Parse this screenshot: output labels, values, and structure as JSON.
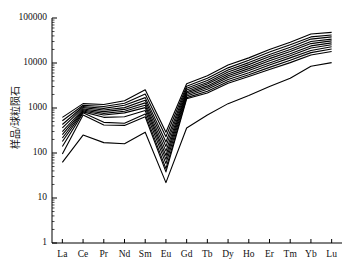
{
  "chart_data": {
    "type": "line",
    "title": "",
    "xlabel": "",
    "ylabel": "样品/球粒陨石",
    "x_categories": [
      "La",
      "Ce",
      "Pr",
      "Nd",
      "Sm",
      "Eu",
      "Gd",
      "Tb",
      "Dy",
      "Ho",
      "Er",
      "Tm",
      "Yb",
      "Lu"
    ],
    "y_tick_labels": [
      "100000",
      "10000",
      "1000",
      "100",
      "10",
      "1"
    ],
    "y_tick_values": [
      100000,
      10000,
      1000,
      100,
      10,
      1
    ],
    "ylim": [
      1,
      100000
    ],
    "y_scale": "log",
    "grid": false,
    "legend": false,
    "legend_position": "none",
    "minor_ticks": true,
    "line_color": "#000000",
    "background_color": "#ffffff",
    "axis_color": "#000000",
    "series": [
      {
        "name": "sample-1",
        "values": [
          620,
          1250,
          1200,
          1450,
          2550,
          290,
          3450,
          5200,
          9000,
          13000,
          20000,
          29000,
          44000,
          48000
        ]
      },
      {
        "name": "sample-2",
        "values": [
          520,
          1150,
          1080,
          1280,
          2050,
          230,
          3050,
          4600,
          7800,
          11500,
          17500,
          25500,
          38000,
          42000
        ]
      },
      {
        "name": "sample-3",
        "values": [
          430,
          1080,
          980,
          1150,
          1700,
          175,
          2750,
          4100,
          7000,
          10200,
          15500,
          22500,
          34000,
          38000
        ]
      },
      {
        "name": "sample-4",
        "values": [
          360,
          1020,
          900,
          1020,
          1480,
          140,
          2500,
          3700,
          6300,
          9200,
          14000,
          20000,
          30000,
          34000
        ]
      },
      {
        "name": "sample-5",
        "values": [
          300,
          950,
          830,
          930,
          1300,
          110,
          2300,
          3400,
          5700,
          8300,
          12500,
          18000,
          27000,
          31000
        ]
      },
      {
        "name": "sample-6",
        "values": [
          255,
          900,
          760,
          850,
          1150,
          88,
          2150,
          3100,
          5200,
          7500,
          11200,
          16000,
          24000,
          28000
        ]
      },
      {
        "name": "sample-7",
        "values": [
          215,
          860,
          700,
          780,
          1020,
          72,
          2000,
          2850,
          4750,
          6800,
          10000,
          14500,
          21500,
          25500
        ]
      },
      {
        "name": "sample-8",
        "values": [
          180,
          820,
          620,
          640,
          880,
          58,
          1850,
          2600,
          4300,
          6100,
          9000,
          13000,
          19000,
          23000
        ]
      },
      {
        "name": "sample-9",
        "values": [
          140,
          780,
          480,
          460,
          740,
          45,
          1700,
          2350,
          3900,
          5500,
          8000,
          11500,
          17000,
          20500
        ]
      },
      {
        "name": "sample-10",
        "values": [
          95,
          700,
          420,
          410,
          640,
          38,
          1600,
          2150,
          3550,
          5000,
          7200,
          10200,
          15000,
          18000
        ]
      },
      {
        "name": "sample-11",
        "values": [
          62,
          250,
          170,
          160,
          290,
          22,
          360,
          700,
          1250,
          1900,
          3000,
          4600,
          8500,
          10200
        ]
      }
    ]
  },
  "axes": {
    "y_label_text": "样品/球粒陨石",
    "y_max_label": "100000",
    "y_min_label": "1"
  }
}
